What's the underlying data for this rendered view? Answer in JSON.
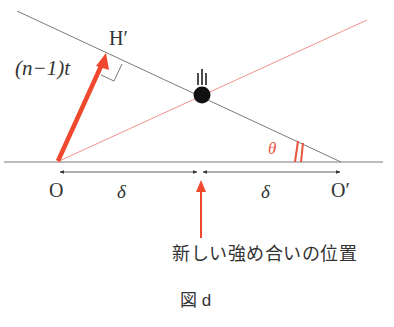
{
  "labels": {
    "path_difference": "(n−1)t",
    "point_h_prime": "H′",
    "angle": "θ",
    "point_o": "O",
    "point_o_prime": "O′",
    "delta_left": "δ",
    "delta_right": "δ",
    "new_max_position": "新しい強め合いの位置",
    "figure_caption": "図 d"
  },
  "colors": {
    "line_gray": "#7a7a7a",
    "arrow_red": "#f0472f",
    "thin_red": "#f2928a",
    "text": "#333333",
    "angle_label": "#e8553f"
  }
}
